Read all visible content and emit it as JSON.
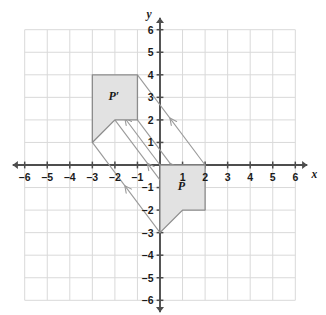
{
  "chart_data": {
    "type": "scatter",
    "title": "",
    "xlabel": "x",
    "ylabel": "y",
    "xlim": [
      -6,
      6
    ],
    "ylim": [
      -6,
      6
    ],
    "grid": true,
    "grid_step": 1,
    "legend": "none",
    "x_ticks": [
      -6,
      -5,
      -4,
      -3,
      -2,
      -1,
      1,
      2,
      3,
      4,
      5,
      6
    ],
    "y_ticks": [
      -6,
      -5,
      -4,
      -3,
      -2,
      -1,
      1,
      2,
      3,
      4,
      5,
      6
    ],
    "x_tick_labels": [
      "–6",
      "–5",
      "–4",
      "–3",
      "–2",
      "–1",
      "1",
      "2",
      "3",
      "4",
      "5",
      "6"
    ],
    "y_tick_labels": [
      "–6",
      "–5",
      "–4",
      "–3",
      "–2",
      "–1",
      "1",
      "2",
      "3",
      "4",
      "5",
      "6"
    ],
    "shapes": [
      {
        "name": "P",
        "label": "P",
        "label_position": [
          0.95,
          -0.95
        ],
        "vertices": [
          [
            0,
            0
          ],
          [
            2,
            0
          ],
          [
            2,
            -2
          ],
          [
            1,
            -2
          ],
          [
            0,
            -3
          ]
        ],
        "fill": "#e2e2e2",
        "stroke": "#8c8c8c"
      },
      {
        "name": "P-prime",
        "label": "P′",
        "label_position": [
          -2.05,
          3.05
        ],
        "vertices": [
          [
            -3,
            4
          ],
          [
            -1,
            4
          ],
          [
            -1,
            2
          ],
          [
            -2,
            2
          ],
          [
            -3,
            1
          ]
        ],
        "fill": "#e2e2e2",
        "stroke": "#8c8c8c"
      }
    ],
    "translation_vector": [
      -3,
      4
    ],
    "arrows": [
      {
        "from": [
          0,
          0
        ],
        "to": [
          -3,
          4
        ]
      },
      {
        "from": [
          2,
          0
        ],
        "to": [
          -1,
          4
        ]
      },
      {
        "from": [
          2,
          -2
        ],
        "to": [
          -1,
          2
        ]
      },
      {
        "from": [
          1,
          -2
        ],
        "to": [
          -2,
          2
        ]
      },
      {
        "from": [
          0,
          -3
        ],
        "to": [
          -3,
          1
        ]
      }
    ],
    "annotations": []
  },
  "colors": {
    "grid_line": "#d9d9d9",
    "axis": "#4d4d4d",
    "shape_fill": "#e2e2e2",
    "shape_stroke": "#8c8c8c",
    "arrow": "#9a9a9a",
    "text": "#1a1a1a",
    "background": "#ffffff"
  },
  "axes": {
    "x_axis_name": "x",
    "y_axis_name": "y"
  }
}
